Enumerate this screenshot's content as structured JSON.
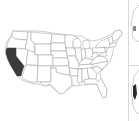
{
  "map": {
    "title": "",
    "region": "United States (contiguous)",
    "highlighted_states": [
      "California"
    ],
    "colors": {
      "background": "#ffffff",
      "state_fill": "#ffffff",
      "state_stroke": "#9a9a9a",
      "highlight_fill": "#3a3a3a",
      "divider": "#d8d8d8"
    }
  },
  "side_panels": [
    {
      "name": "top-inset",
      "highlight_fill": "#8a8a8a"
    },
    {
      "name": "bottom-inset",
      "highlight_fill": "#2a2a2a"
    }
  ]
}
